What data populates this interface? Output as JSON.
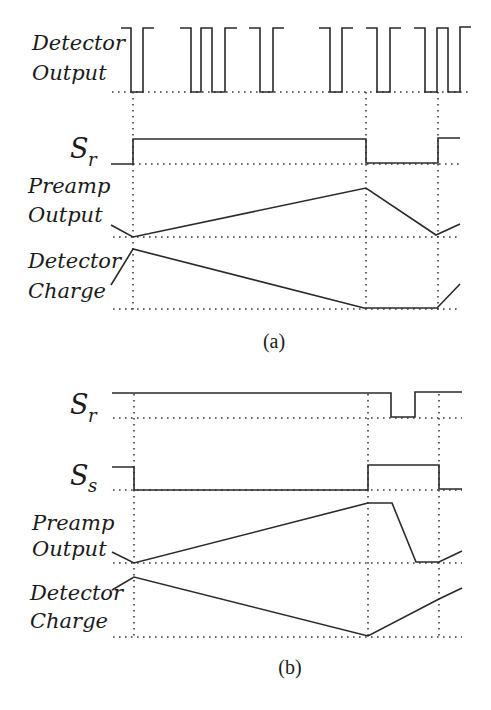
{
  "figure": {
    "panel_a": {
      "caption": "(a)",
      "signals": [
        {
          "id": "detector_output",
          "label_line1": "Detector",
          "label_line2": "Output"
        },
        {
          "id": "s_r",
          "label_main": "S",
          "label_sub": "r"
        },
        {
          "id": "preamp_output",
          "label_line1": "Preamp",
          "label_line2": "Output"
        },
        {
          "id": "detector_charge",
          "label_line1": "Detector",
          "label_line2": "Charge"
        }
      ]
    },
    "panel_b": {
      "caption": "(b)",
      "signals": [
        {
          "id": "s_r",
          "label_main": "S",
          "label_sub": "r"
        },
        {
          "id": "s_s",
          "label_main": "S",
          "label_sub": "s"
        },
        {
          "id": "preamp_output",
          "label_line1": "Preamp",
          "label_line2": "Output"
        },
        {
          "id": "detector_charge",
          "label_line1": "Detector",
          "label_line2": "Charge"
        }
      ]
    },
    "time_markers_x": [
      133,
      366,
      438
    ],
    "colors": {
      "ink": "#2a2a2a",
      "background": "#ffffff"
    }
  }
}
